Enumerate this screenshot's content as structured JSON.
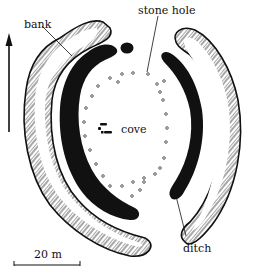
{
  "diagram": {
    "type": "archaeological-site-plan",
    "colors": {
      "ink": "#111111",
      "background": "#ffffff",
      "hatch": "#222222"
    },
    "labels": {
      "bank": "bank",
      "stone_hole": "stone hole",
      "cove": "cove",
      "ditch": "ditch",
      "scale": "20 m"
    },
    "north_arrow": {
      "direction": "up"
    },
    "features": [
      {
        "name": "outer-bank-west",
        "kind": "bank"
      },
      {
        "name": "outer-bank-east",
        "kind": "bank"
      },
      {
        "name": "ditch-west",
        "kind": "ditch"
      },
      {
        "name": "ditch-east",
        "kind": "ditch"
      },
      {
        "name": "stone-hole-ring",
        "kind": "stone holes",
        "count": 30
      },
      {
        "name": "cove",
        "kind": "cove stones"
      }
    ],
    "scale_bar": {
      "label": "20 m"
    }
  }
}
